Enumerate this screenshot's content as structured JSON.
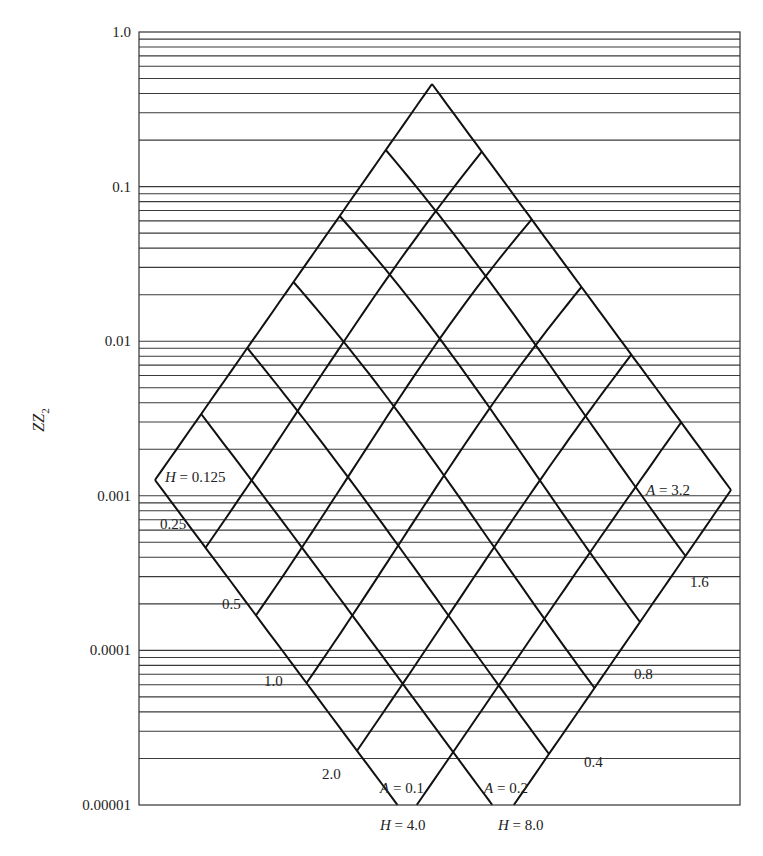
{
  "chart_data": {
    "type": "line",
    "title": "",
    "ylabel": "ZZ2",
    "ylabel_main": "ZZ",
    "ylabel_sub": "2",
    "xlabel": "",
    "yscale": "log",
    "ylim": [
      1e-05,
      1.0
    ],
    "ytick_labels": [
      "1.0",
      "0.1",
      "0.01",
      "0.001",
      "0.0001",
      "0.00001"
    ],
    "ytick_values": [
      1.0,
      0.1,
      0.01,
      0.001,
      0.0001,
      1e-05
    ],
    "grid": "horizontal log minor lines at 1-9 x 10^k",
    "H_curves": {
      "values": [
        0.125,
        0.25,
        0.5,
        1.0,
        2.0,
        4.0,
        8.0
      ],
      "labels": [
        "H = 0.125",
        "0.25",
        "0.5",
        "1.0",
        "2.0",
        "H = 4.0",
        "H = 8.0"
      ]
    },
    "A_curves": {
      "values": [
        0.1,
        0.2,
        0.4,
        0.8,
        1.6,
        3.2
      ],
      "labels": [
        "A = 0.1",
        "A = 0.2",
        "0.4",
        "0.8",
        "1.6",
        "A = 3.2"
      ]
    },
    "lattice": {
      "corners": {
        "left": [
          155,
          480
        ],
        "top": [
          432,
          84
        ],
        "right": [
          731,
          490
        ],
        "bottom": [
          458,
          886
        ]
      },
      "n": 7
    },
    "annotations": [
      {
        "text": "H = 0.125",
        "italic_prefix": "H",
        "x": 165,
        "y": 482
      },
      {
        "text": "0.25",
        "x": 160,
        "y": 529
      },
      {
        "text": "0.5",
        "x": 222,
        "y": 609
      },
      {
        "text": "1.0",
        "x": 264,
        "y": 686
      },
      {
        "text": "2.0",
        "x": 322,
        "y": 779
      },
      {
        "text": "A = 0.1",
        "italic_prefix": "A",
        "x": 380,
        "y": 793
      },
      {
        "text": "A = 0.2",
        "italic_prefix": "A",
        "x": 484,
        "y": 793
      },
      {
        "text": "H = 4.0",
        "italic_prefix": "H",
        "x": 380,
        "y": 830
      },
      {
        "text": "H = 8.0",
        "italic_prefix": "H",
        "x": 498,
        "y": 830
      },
      {
        "text": "0.4",
        "x": 584,
        "y": 767
      },
      {
        "text": "0.8",
        "x": 634,
        "y": 679
      },
      {
        "text": "1.6",
        "x": 690,
        "y": 587
      },
      {
        "text": "A = 3.2",
        "italic_prefix": "A",
        "x": 646,
        "y": 495
      }
    ]
  }
}
